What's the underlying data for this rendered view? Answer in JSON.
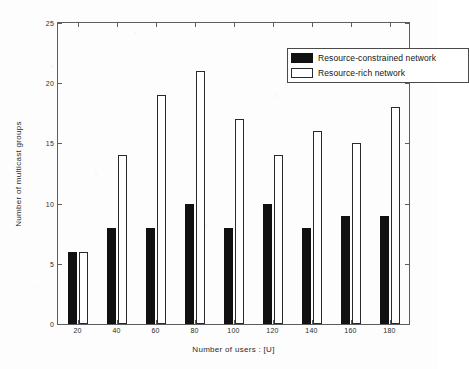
{
  "chart_data": {
    "type": "bar",
    "title": "",
    "xlabel": "Number of users : [U]",
    "ylabel": "Number of multicast groups",
    "categories": [
      "20",
      "40",
      "60",
      "80",
      "100",
      "120",
      "140",
      "160",
      "180"
    ],
    "series": [
      {
        "name": "Resource-constrained network",
        "color": "#111111",
        "style": "filled",
        "values": [
          6,
          8,
          8,
          10,
          8,
          10,
          8,
          9,
          9
        ]
      },
      {
        "name": "Resource-rich network",
        "color": "#ffffff",
        "style": "outlined",
        "values": [
          6,
          14,
          19,
          21,
          17,
          14,
          16,
          15,
          18
        ]
      }
    ],
    "xlim": [
      10,
      190
    ],
    "ylim": [
      0,
      25
    ],
    "yticks": [
      0,
      5,
      10,
      15,
      20,
      25
    ],
    "ytick_labels": [
      "0",
      "5",
      "10",
      "15",
      "20",
      "25"
    ],
    "xticks": [
      20,
      40,
      60,
      80,
      100,
      120,
      140,
      160,
      180
    ],
    "grid": false,
    "legend_position": "top-right",
    "legend_entries": [
      "Resource-constrained network",
      "Resource-rich network"
    ]
  }
}
